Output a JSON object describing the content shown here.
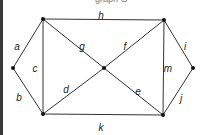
{
  "figure": {
    "title_cut": "graph G",
    "vertices": [
      {
        "id": "v_tl",
        "x": 43,
        "y": 19
      },
      {
        "id": "v_tr",
        "x": 164,
        "y": 20
      },
      {
        "id": "v_l",
        "x": 13,
        "y": 68
      },
      {
        "id": "v_c",
        "x": 104,
        "y": 68
      },
      {
        "id": "v_r",
        "x": 193,
        "y": 68
      },
      {
        "id": "v_bl",
        "x": 43,
        "y": 114
      },
      {
        "id": "v_br",
        "x": 163,
        "y": 115
      }
    ],
    "edges": [
      {
        "label": "a",
        "from": "v_l",
        "to": "v_tl",
        "lx": 17,
        "ly": 47
      },
      {
        "label": "b",
        "from": "v_l",
        "to": "v_bl",
        "lx": 19,
        "ly": 98
      },
      {
        "label": "c",
        "from": "v_tl",
        "to": "v_bl",
        "lx": 35,
        "ly": 69
      },
      {
        "label": "h",
        "from": "v_tl",
        "to": "v_tr",
        "lx": 101,
        "ly": 16
      },
      {
        "label": "g",
        "from": "v_tl",
        "to": "v_c",
        "lx": 82,
        "ly": 47
      },
      {
        "label": "f",
        "from": "v_tr",
        "to": "v_c",
        "lx": 125,
        "ly": 47
      },
      {
        "label": "d",
        "from": "v_bl",
        "to": "v_c",
        "lx": 66,
        "ly": 90
      },
      {
        "label": "e",
        "from": "v_br",
        "to": "v_c",
        "lx": 138,
        "ly": 92
      },
      {
        "label": "k",
        "from": "v_bl",
        "to": "v_br",
        "lx": 101,
        "ly": 128
      },
      {
        "label": "m",
        "from": "v_tr",
        "to": "v_br",
        "lx": 168,
        "ly": 69
      },
      {
        "label": "i",
        "from": "v_tr",
        "to": "v_r",
        "lx": 185,
        "ly": 47
      },
      {
        "label": "j",
        "from": "v_r",
        "to": "v_br",
        "lx": 181,
        "ly": 99
      }
    ]
  }
}
